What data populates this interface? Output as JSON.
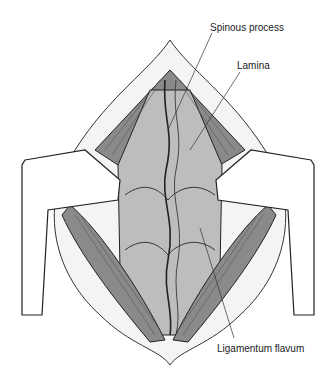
{
  "figure": {
    "labels": {
      "spinous_process": "Spinous process",
      "lamina": "Lamina",
      "ligamentum_flavum": "Ligamentum flavum"
    },
    "colors": {
      "muscle": "#8c8c8c",
      "bone": "#bdbdbd",
      "line": "#222222",
      "retractor": "#ffffff"
    }
  }
}
